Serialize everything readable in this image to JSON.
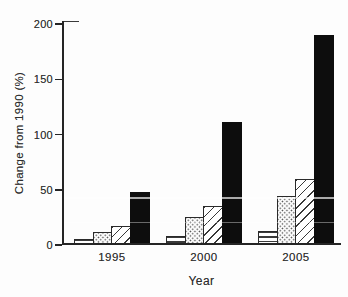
{
  "colors": {
    "paper": "#fdfdfd",
    "ink": "#2e2e2e",
    "axis": "#252525",
    "solid_bar_fill": "#0d0d0d"
  },
  "chart_data": {
    "type": "bar",
    "title": "",
    "xlabel": "Year",
    "ylabel": "Change from 1990 (%)",
    "categories": [
      "1995",
      "2000",
      "2005"
    ],
    "series": [
      {
        "name": "series-1-horizontal-stripes",
        "pattern": "hlines",
        "values": [
          5,
          8,
          13
        ]
      },
      {
        "name": "series-2-stipple-dots",
        "pattern": "dots",
        "values": [
          12,
          25,
          44
        ]
      },
      {
        "name": "series-3-diagonal-hatch",
        "pattern": "diag",
        "values": [
          17,
          35,
          60
        ]
      },
      {
        "name": "series-4-solid-black",
        "pattern": "solid",
        "values": [
          48,
          111,
          190
        ]
      }
    ],
    "ylim": [
      0,
      200
    ],
    "yticks": [
      0,
      50,
      100,
      150,
      200
    ],
    "grid": false,
    "legend": "none"
  }
}
